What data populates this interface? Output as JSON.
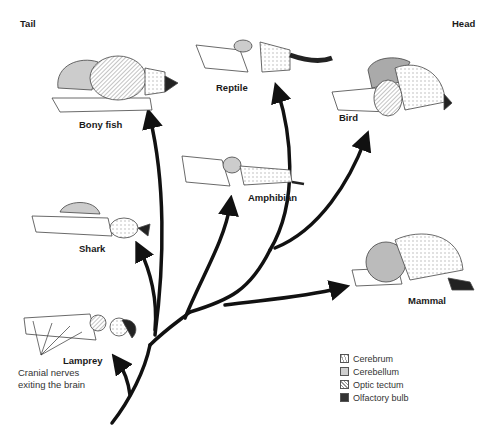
{
  "corners": {
    "tail": "Tail",
    "head": "Head"
  },
  "animals": [
    {
      "id": "bony-fish",
      "label": "Bony fish"
    },
    {
      "id": "reptile",
      "label": "Reptile"
    },
    {
      "id": "bird",
      "label": "Bird"
    },
    {
      "id": "amphibian",
      "label": "Amphibian"
    },
    {
      "id": "shark",
      "label": "Shark"
    },
    {
      "id": "mammal",
      "label": "Mammal"
    },
    {
      "id": "lamprey",
      "label": "Lamprey"
    }
  ],
  "annotation": {
    "line1": "Cranial nerves",
    "line2": "exiting the brain"
  },
  "legend": [
    {
      "label": "Cerebrum",
      "pattern": "stippled"
    },
    {
      "label": "Cerebellum",
      "pattern": "light-gray"
    },
    {
      "label": "Optic tectum",
      "pattern": "hatched"
    },
    {
      "label": "Olfactory bulb",
      "pattern": "dark"
    }
  ],
  "colors": {
    "arrow": "#111111",
    "background": "#ffffff"
  }
}
